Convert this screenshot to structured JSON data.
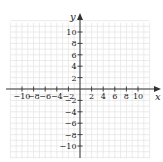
{
  "chart_data": {
    "type": "scatter",
    "title": "",
    "xlabel": "x",
    "ylabel": "y",
    "xlim": [
      -12,
      12
    ],
    "ylim": [
      -12,
      12
    ],
    "grid": true,
    "legend": null,
    "x_ticks": [
      -10,
      -8,
      -6,
      -4,
      -2,
      2,
      4,
      6,
      8,
      10
    ],
    "y_ticks": [
      10,
      8,
      6,
      4,
      2,
      -2,
      -4,
      -6,
      -8,
      -10
    ],
    "x_tick_labels": [
      "−10",
      "−8",
      "−6",
      "−4",
      "−2",
      "2",
      "4",
      "6",
      "8",
      "10"
    ],
    "y_tick_labels": [
      "10",
      "8",
      "6",
      "4",
      "2",
      "−2",
      "−4",
      "−6",
      "−8",
      "−10"
    ],
    "series": []
  },
  "axes": {
    "x_label": "x",
    "y_label": "y"
  },
  "colors": {
    "axis": "#333333",
    "grid": "#e2e2e2",
    "text": "#222222"
  }
}
